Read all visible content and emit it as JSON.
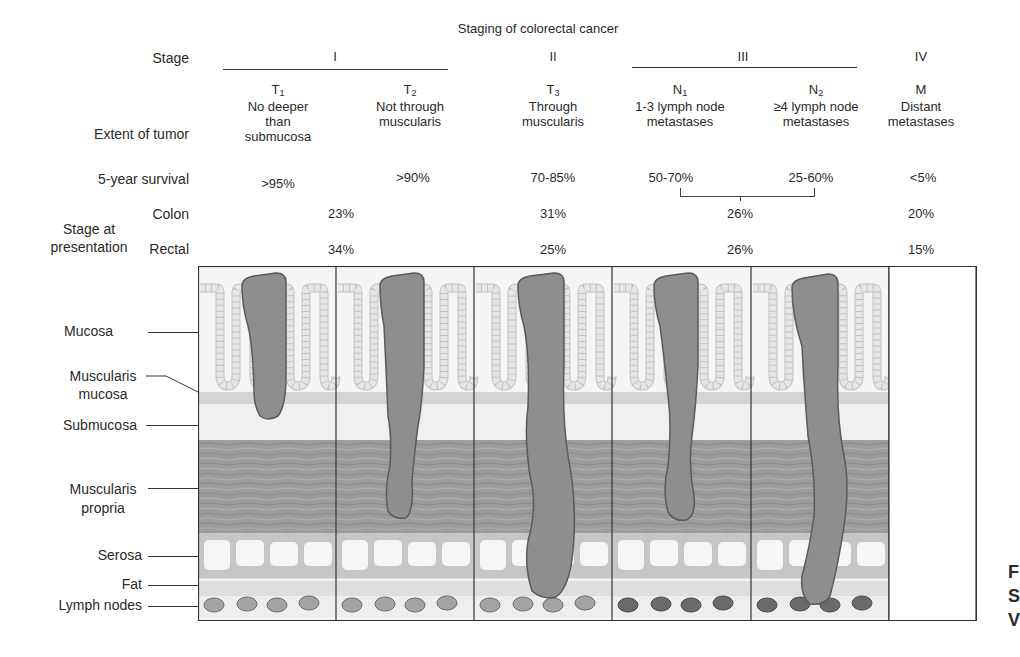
{
  "title": "Staging of colorectal cancer",
  "row_labels": {
    "stage": "Stage",
    "extent": "Extent of tumor",
    "survival": "5-year survival",
    "presentation": "Stage at presentation",
    "presentation_line1": "Stage at",
    "presentation_line2": "presentation",
    "colon": "Colon",
    "rectal": "Rectal"
  },
  "stages": [
    {
      "stage": "I",
      "columns": [
        "T1",
        "T2"
      ]
    },
    {
      "stage": "II",
      "columns": [
        "T3"
      ]
    },
    {
      "stage": "III",
      "columns": [
        "N1",
        "N2"
      ]
    },
    {
      "stage": "IV",
      "columns": [
        "M"
      ]
    }
  ],
  "columns": [
    {
      "code": "T",
      "sub": "1",
      "extent": [
        "No deeper",
        "than",
        "submucosa"
      ],
      "survival": ">95%"
    },
    {
      "code": "T",
      "sub": "2",
      "extent": [
        "Not through",
        "muscularis"
      ],
      "survival": ">90%"
    },
    {
      "code": "T",
      "sub": "3",
      "extent": [
        "Through",
        "muscularis"
      ],
      "survival": "70-85%"
    },
    {
      "code": "N",
      "sub": "1",
      "extent": [
        "1-3 lymph node",
        "metastases"
      ],
      "survival": "50-70%"
    },
    {
      "code": "N",
      "sub": "2",
      "extent": [
        "≥4 lymph node",
        "metastases"
      ],
      "survival": "25-60%"
    },
    {
      "code": "M",
      "sub": "",
      "extent": [
        "Distant",
        "metastases"
      ],
      "survival": "<5%"
    }
  ],
  "presentation": {
    "colon": {
      "I": "23%",
      "II": "31%",
      "III": "26%",
      "IV": "20%"
    },
    "rectal": {
      "I": "34%",
      "II": "25%",
      "III": "26%",
      "IV": "15%"
    }
  },
  "layers": [
    {
      "label": "Mucosa"
    },
    {
      "label_line1": "Muscularis",
      "label_line2": "mucosa"
    },
    {
      "label": "Submucosa"
    },
    {
      "label_line1": "Muscularis",
      "label_line2": "propria"
    },
    {
      "label": "Serosa"
    },
    {
      "label": "Fat"
    },
    {
      "label": "Lymph nodes"
    }
  ],
  "colors": {
    "tumor": "#8e8e8e",
    "tumor_outline": "#5a5a5a",
    "mucosa_bg": "#f4f4f4",
    "crypt_cells": "#e2e2e2",
    "muscularis_mucosa": "#d4d4d4",
    "submucosa": "#f2f2f2",
    "muscularis_propria": "#9c9c9c",
    "serosa": "#c8c8c8",
    "fat": "#dedede",
    "lymph_normal": "#9a9a9a",
    "lymph_metastatic": "#6a6a6a"
  },
  "edge_text": [
    "F",
    "S",
    "V"
  ]
}
